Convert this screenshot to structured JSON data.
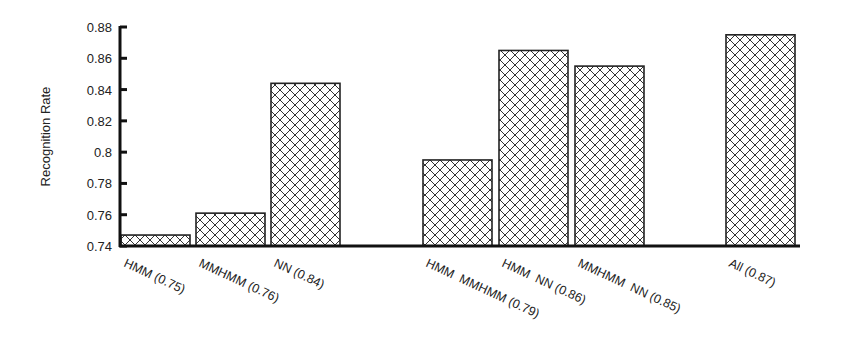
{
  "chart_data": {
    "type": "bar",
    "title": "",
    "xlabel": "",
    "ylabel": "Recognition Rate",
    "ylim": [
      0.74,
      0.88
    ],
    "yticks": [
      "0.74",
      "0.76",
      "0.78",
      "0.8",
      "0.82",
      "0.84",
      "0.86",
      "0.88"
    ],
    "grid": false,
    "legend": null,
    "pattern": "crosshatch",
    "categories": [
      "HMM (0.75)",
      "MMHMM (0.76)",
      "NN (0.84)",
      "HMM  MMHMM (0.79)",
      "HMM  NN (0.86)",
      "MMHMM  NN (0.85)",
      "All (0.87)"
    ],
    "values": [
      0.747,
      0.761,
      0.844,
      0.795,
      0.865,
      0.855,
      0.875
    ]
  },
  "layout": {
    "bar_x": [
      121,
      196,
      271,
      423,
      499,
      575,
      726
    ],
    "bar_width": 69,
    "plot_left": 120,
    "plot_right": 800,
    "y_top_px": 27,
    "y_bottom_px": 246
  },
  "colors": {
    "axis": "#111111",
    "bar_stroke": "#222222",
    "hatch": "#333333",
    "bar_fill": "#ffffff"
  }
}
